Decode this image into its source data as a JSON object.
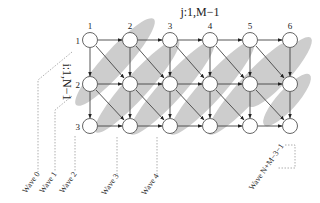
{
  "diagram": {
    "axis_labels": {
      "columns": "j:1,M−1",
      "rows": "i:1,N−1"
    },
    "column_numbers": [
      "1",
      "2",
      "3",
      "4",
      "5",
      "6"
    ],
    "row_numbers": [
      "1",
      "2",
      "3"
    ],
    "waves": [
      {
        "label": "Wave 0"
      },
      {
        "label": "Wave 1"
      },
      {
        "label": "Wave 2"
      },
      {
        "label": "Wave 3"
      },
      {
        "label": "Wave 4"
      },
      {
        "label": "Wave N+M−3−1"
      }
    ],
    "colors": {
      "wave_band": "#c8c8c8",
      "node_fill": "#ffffff",
      "edge": "#444444",
      "guide": "#999999"
    }
  }
}
